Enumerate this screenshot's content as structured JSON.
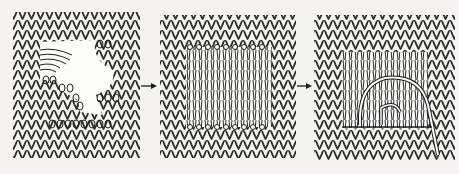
{
  "figure": {
    "background": "#f4f3f0",
    "ink": "#1e1e1e",
    "panels": [
      {
        "id": "damaged",
        "label": "Damaged fabric with hole and loose stitches",
        "x": 13,
        "y": 12,
        "w": 127,
        "h": 146
      },
      {
        "id": "warp-threads",
        "label": "Hole prepared with vertical threads strung between live loops",
        "x": 160,
        "y": 15,
        "w": 136,
        "h": 143
      },
      {
        "id": "reknit",
        "label": "Yarn reknitting stitches across vertical threads",
        "x": 314,
        "y": 15,
        "w": 141,
        "h": 145
      }
    ],
    "arrows": [
      {
        "from": "damaged",
        "to": "warp-threads",
        "x1": 141,
        "x2": 157,
        "y": 86
      },
      {
        "from": "warp-threads",
        "to": "reknit",
        "x1": 297,
        "x2": 312,
        "y": 86
      }
    ]
  }
}
